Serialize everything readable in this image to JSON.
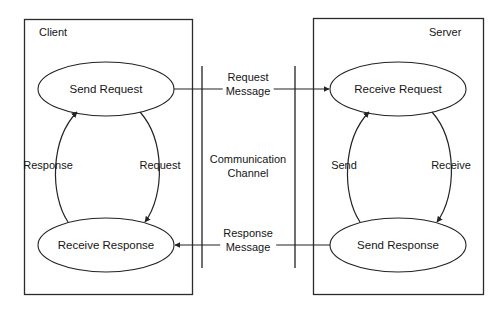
{
  "diagram": {
    "colors": {
      "stroke": "#232323",
      "background": "#ffffff",
      "text": "#151515"
    },
    "containers": [
      {
        "id": "client",
        "label": "Client"
      },
      {
        "id": "server",
        "label": "Server"
      }
    ],
    "nodes": [
      {
        "id": "send-request",
        "label": "Send Request"
      },
      {
        "id": "receive-response",
        "label": "Receive Response"
      },
      {
        "id": "receive-request",
        "label": "Receive Request"
      },
      {
        "id": "send-response",
        "label": "Send Response"
      }
    ],
    "channel": {
      "label_line1": "Communication",
      "label_line2": "Channel"
    },
    "messages": [
      {
        "id": "request-message",
        "line1": "Request",
        "line2": "Message",
        "direction": "client-to-server"
      },
      {
        "id": "response-message",
        "line1": "Response",
        "line2": "Message",
        "direction": "server-to-client"
      }
    ],
    "edge_labels": [
      {
        "id": "client-response-edge",
        "label": "Response"
      },
      {
        "id": "client-request-edge",
        "label": "Request"
      },
      {
        "id": "server-send-edge",
        "label": "Send"
      },
      {
        "id": "server-receive-edge",
        "label": "Receive"
      }
    ]
  }
}
